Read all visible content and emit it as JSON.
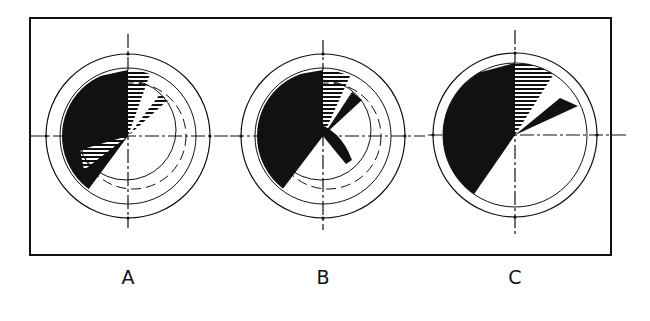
{
  "figure": {
    "panels": [
      {
        "label": "A",
        "cx": 128,
        "cy": 136
      },
      {
        "label": "B",
        "cx": 323,
        "cy": 136
      },
      {
        "label": "C",
        "cx": 515,
        "cy": 135
      }
    ],
    "colors": {
      "ink": "#111111",
      "paper": "#ffffff"
    }
  }
}
